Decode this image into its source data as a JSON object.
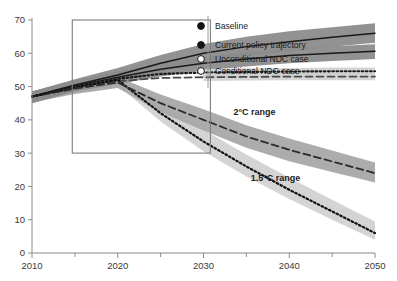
{
  "chart_data": {
    "type": "line",
    "title": "",
    "xlabel": "",
    "ylabel": "",
    "xlim": [
      2010,
      2050
    ],
    "ylim": [
      0,
      70
    ],
    "grid": false,
    "legend_position": "inside-top-right",
    "x_ticks": [
      2010,
      2020,
      2030,
      2040,
      2050
    ],
    "x_minor_ticks": [
      2015,
      2025,
      2035,
      2045
    ],
    "y_ticks": [
      0,
      10,
      20,
      30,
      40,
      50,
      60,
      70
    ],
    "x": [
      2010,
      2015,
      2020,
      2025,
      2030,
      2035,
      2040,
      2045,
      2050
    ],
    "series": [
      {
        "name": "Baseline",
        "style": "solid",
        "color": "#1a1a1a",
        "band_color": "#8c8c8c",
        "marker": "filled-circle",
        "values": [
          47.0,
          50.5,
          53.5,
          57.0,
          60.0,
          62.0,
          63.5,
          64.8,
          66.0
        ],
        "band_low": [
          45.0,
          48.8,
          51.5,
          54.5,
          57.3,
          59.2,
          60.7,
          62.0,
          63.2
        ],
        "band_high": [
          48.5,
          52.2,
          55.6,
          59.5,
          62.8,
          65.0,
          66.6,
          67.8,
          69.0
        ]
      },
      {
        "name": "Current policy trajectory",
        "style": "solid",
        "color": "#1a1a1a",
        "band_color": "#8c8c8c",
        "marker": "filled-circle",
        "values": [
          47.0,
          50.2,
          52.8,
          55.2,
          57.0,
          58.3,
          59.3,
          60.0,
          60.6
        ],
        "band_low": [
          45.0,
          48.5,
          50.8,
          53.0,
          54.8,
          56.0,
          57.0,
          57.7,
          58.3
        ],
        "band_high": [
          48.5,
          51.9,
          54.6,
          57.2,
          59.0,
          60.4,
          61.4,
          62.1,
          62.7
        ]
      },
      {
        "name": "Unconditional NDC case",
        "style": "dotted",
        "color": "#1a1a1a",
        "band_color": "#cfcfcf",
        "marker": "open-circle",
        "values": [
          47.0,
          49.6,
          52.3,
          53.8,
          54.2,
          54.4,
          54.5,
          54.6,
          54.6
        ]
      },
      {
        "name": "Conditional NDC case",
        "style": "dashed",
        "color": "#4a4a4a",
        "band_color": "#cfcfcf",
        "marker": "open-circle",
        "values": [
          47.0,
          49.3,
          51.6,
          52.6,
          52.8,
          52.9,
          53.0,
          53.0,
          53.0
        ]
      },
      {
        "name": "2°C range",
        "style": "dashed",
        "color": "#2b2b2b",
        "band_color": "#a8a8a8",
        "marker": "none",
        "values": [
          47.0,
          49.5,
          51.2,
          45.0,
          40.0,
          35.0,
          31.0,
          27.5,
          24.0
        ],
        "band_low": [
          45.2,
          47.8,
          49.6,
          42.3,
          36.8,
          31.6,
          27.6,
          24.3,
          21.2
        ],
        "band_high": [
          48.6,
          51.2,
          52.9,
          47.6,
          43.2,
          38.4,
          34.4,
          30.8,
          27.2
        ]
      },
      {
        "name": "1.5°C range",
        "style": "dotted",
        "color": "#111111",
        "band_color": "#d2d2d2",
        "marker": "none",
        "values": [
          47.0,
          49.8,
          52.0,
          42.0,
          33.5,
          26.0,
          19.0,
          12.5,
          6.0
        ],
        "band_low": [
          45.4,
          48.2,
          50.4,
          39.5,
          30.6,
          23.0,
          16.2,
          10.0,
          4.0
        ],
        "band_high": [
          48.6,
          51.4,
          53.4,
          45.0,
          37.0,
          29.6,
          22.6,
          16.0,
          9.5
        ]
      }
    ],
    "annotations": [
      {
        "text": "2°C range",
        "x": 2033.5,
        "y": 41.5
      },
      {
        "text": "1.5°C range",
        "x": 2035.5,
        "y": 21.5
      }
    ],
    "inset_box": {
      "x0": 2014.7,
      "x1": 2030.8,
      "y0": 30.0,
      "y1": 70.0
    }
  },
  "legend": {
    "items": [
      {
        "label": "Baseline",
        "marker": "filled-circle"
      },
      {
        "label": "Current policy trajectory",
        "marker": "filled-circle"
      },
      {
        "label": "Unconditional NDC case",
        "marker": "open-circle"
      },
      {
        "label": "Conditional NDC case",
        "marker": "open-circle"
      }
    ]
  },
  "axes": {
    "y_tick_labels": [
      "70",
      "60",
      "50",
      "40",
      "30",
      "20",
      "10",
      "0"
    ],
    "x_tick_labels": [
      "2010",
      "2020",
      "2030",
      "2040",
      "2050"
    ]
  }
}
